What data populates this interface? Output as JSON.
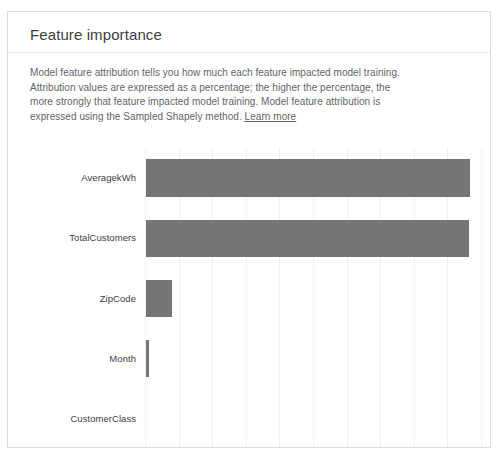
{
  "card": {
    "title": "Feature importance",
    "description_line1": "Model feature attribution tells you how much each feature impacted model training.",
    "description_line2": "Attribution values are expressed as a percentage; the higher the percentage, the more",
    "description_line3": "strongly that feature impacted model training. Model feature attribution is expressed",
    "description_line4": "using the Sampled Shapely method.",
    "learn_more_label": "Learn more"
  },
  "colors": {
    "bar": "#757575",
    "gridline": "#f1f1f1",
    "axis": "#9aa0a6",
    "card_border": "#dcdcdc",
    "title_text": "#3c4043",
    "body_text": "#5f6368"
  },
  "chart_data": {
    "type": "bar",
    "orientation": "horizontal",
    "title": "Feature importance",
    "xlabel": "",
    "ylabel": "",
    "categories": [
      "AveragekWh",
      "TotalCustomers",
      "ZipCode",
      "Month",
      "CustomerClass"
    ],
    "values": [
      0.965,
      0.962,
      0.078,
      0.009,
      0.0
    ],
    "value_unit": "fraction of maximum attribution",
    "xlim": [
      0,
      1.0
    ],
    "grid": true,
    "gridline_count": 10,
    "legend": null,
    "series": [
      {
        "name": "Feature attribution",
        "values": [
          0.965,
          0.962,
          0.078,
          0.009,
          0.0
        ]
      }
    ]
  }
}
